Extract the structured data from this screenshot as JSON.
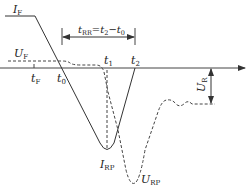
{
  "diagram": {
    "type": "reverse-recovery-waveform",
    "colors": {
      "line": "#333333",
      "background": "#ffffff"
    },
    "labels": {
      "IF": {
        "main": "I",
        "sub": "F"
      },
      "UF": {
        "main": "U",
        "sub": "F"
      },
      "tF": {
        "main": "t",
        "sub": "F"
      },
      "t0": {
        "main": "t",
        "sub": "0"
      },
      "t1": {
        "main": "t",
        "sub": "1"
      },
      "t2": {
        "main": "t",
        "sub": "2"
      },
      "IRP": {
        "main": "I",
        "sub": "RP"
      },
      "URP": {
        "main": "U",
        "sub": "RP"
      },
      "UR": {
        "main": "U",
        "sub": "R"
      },
      "tRR": {
        "main": "t",
        "sub": "RR",
        "eq": "=",
        "t2main": "t",
        "t2sub": "2",
        "minus": "−",
        "t0main": "t",
        "t0sub": "0"
      }
    },
    "curves": {
      "current": {
        "style": "solid",
        "name": "I"
      },
      "voltage": {
        "style": "dashed",
        "name": "U"
      }
    }
  }
}
